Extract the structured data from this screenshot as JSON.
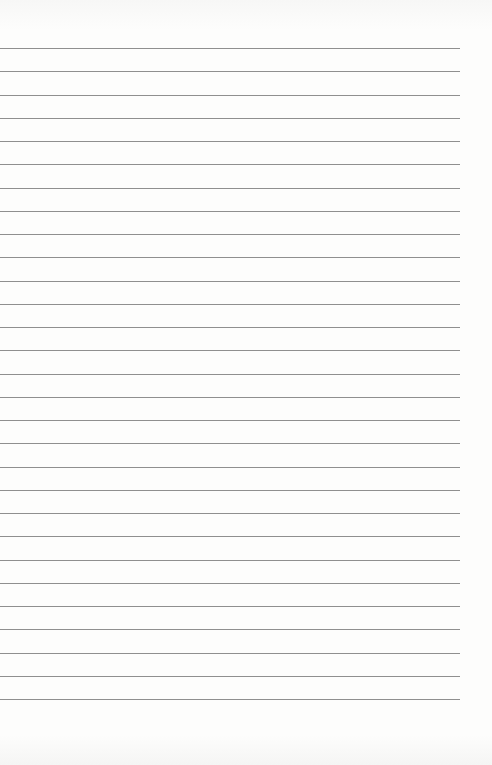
{
  "paper": {
    "type": "lined-paper",
    "background_color": "#fdfdfc",
    "line_color": "#8f8f8f",
    "line_count": 29,
    "first_line_y": 48,
    "line_spacing": 23.25,
    "line_width": 460
  }
}
